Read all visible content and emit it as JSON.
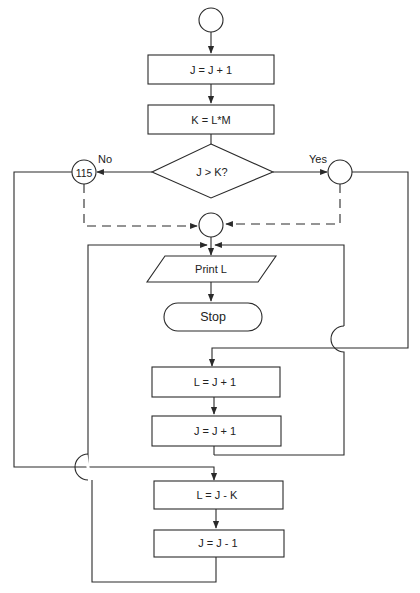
{
  "diagram": {
    "type": "flowchart",
    "nodes": [
      {
        "id": "start",
        "shape": "connector",
        "label": ""
      },
      {
        "id": "p1",
        "shape": "process",
        "label": "J = J + 1"
      },
      {
        "id": "p2",
        "shape": "process",
        "label": "K = L*M"
      },
      {
        "id": "d1",
        "shape": "decision",
        "label": "J > K?"
      },
      {
        "id": "c115",
        "shape": "connector",
        "label": "115"
      },
      {
        "id": "cyes",
        "shape": "connector",
        "label": ""
      },
      {
        "id": "cmid",
        "shape": "connector",
        "label": ""
      },
      {
        "id": "io1",
        "shape": "io",
        "label": "Print L"
      },
      {
        "id": "stop",
        "shape": "terminal",
        "label": "Stop"
      },
      {
        "id": "p3",
        "shape": "process",
        "label": "L = J + 1"
      },
      {
        "id": "p4",
        "shape": "process",
        "label": "J = J + 1"
      },
      {
        "id": "p5",
        "shape": "process",
        "label": "L = J - K"
      },
      {
        "id": "p6",
        "shape": "process",
        "label": "J = J - 1"
      }
    ],
    "edge_labels": {
      "no": "No",
      "yes": "Yes"
    }
  }
}
